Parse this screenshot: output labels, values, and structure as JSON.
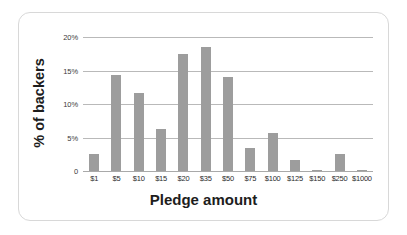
{
  "chart_data": {
    "type": "bar",
    "title": "",
    "xlabel": "Pledge amount",
    "ylabel": "% of backers",
    "categories": [
      "$1",
      "$5",
      "$10",
      "$15",
      "$20",
      "$35",
      "$50",
      "$75",
      "$100",
      "$125",
      "$150",
      "$250",
      "$1000"
    ],
    "values": [
      2.5,
      14.3,
      11.7,
      6.3,
      17.5,
      18.5,
      14.1,
      3.4,
      5.7,
      1.7,
      0.15,
      2.5,
      0.1
    ],
    "series": [
      {
        "name": "% of backers",
        "values": [
          2.5,
          14.3,
          11.7,
          6.3,
          17.5,
          18.5,
          14.1,
          3.4,
          5.7,
          1.7,
          0.15,
          2.5,
          0.1
        ]
      }
    ],
    "ylim": [
      0,
      20
    ],
    "yticks": [
      0,
      5,
      10,
      15,
      20
    ],
    "ytick_labels": [
      "0",
      "5%",
      "10%",
      "15%",
      "20%"
    ],
    "grid": true,
    "legend": false,
    "bar_color": "#9d9d9d",
    "gridline_color": "#b9b9b9"
  }
}
